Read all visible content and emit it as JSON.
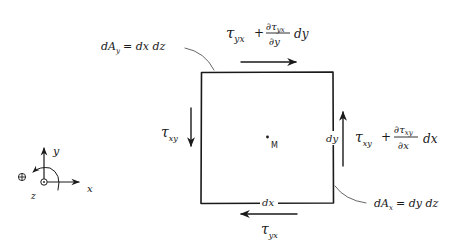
{
  "diagram": {
    "element": {
      "center_label": "M",
      "width_label": "dx",
      "height_label": "dy"
    },
    "stresses": {
      "top": {
        "symbol": "τ",
        "subscript": "yx",
        "plus": "+",
        "partial_num": "∂τ",
        "partial_num_sub": "yx",
        "partial_den": "∂y",
        "increment": "dy",
        "direction": "right"
      },
      "bottom": {
        "symbol": "τ",
        "subscript": "yx",
        "direction": "left"
      },
      "left": {
        "symbol": "τ",
        "subscript": "xy",
        "direction": "down"
      },
      "right": {
        "symbol": "τ",
        "subscript": "xy",
        "plus": "+",
        "partial_num": "∂τ",
        "partial_num_sub": "xy",
        "partial_den": "∂x",
        "increment": "dx",
        "direction": "up"
      }
    },
    "areas": {
      "top": {
        "lhs": "dA",
        "lhs_sub": "y",
        "rhs": "= dx dz"
      },
      "right": {
        "lhs": "dA",
        "lhs_sub": "x",
        "rhs": "= dy dz"
      }
    },
    "axes": {
      "x_label": "x",
      "y_label": "y",
      "z_label": "z",
      "rotation_sign": "⊕"
    },
    "colors": {
      "ink": "#1a1a1a",
      "leader": "#555555",
      "background": "#ffffff"
    }
  }
}
